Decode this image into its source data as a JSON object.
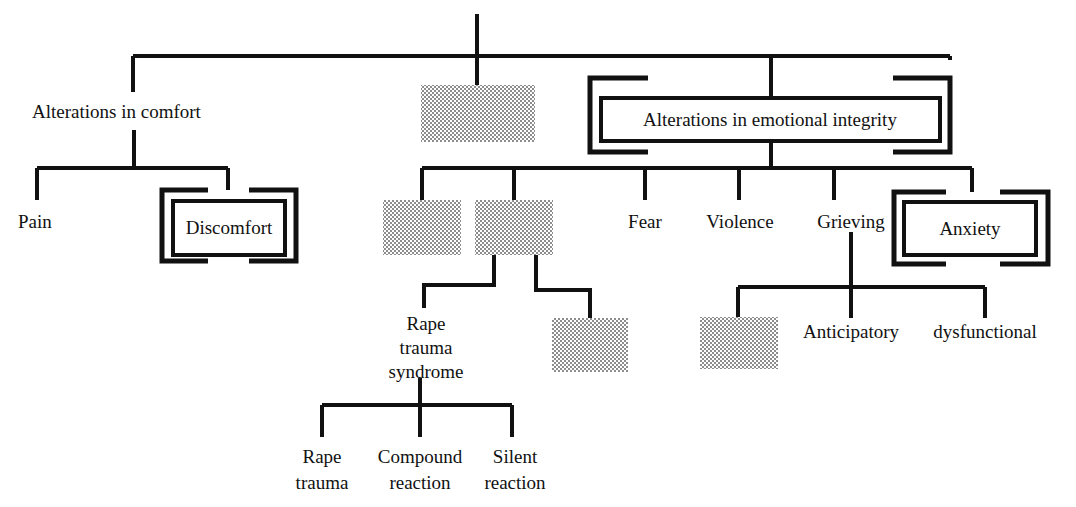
{
  "diagram": {
    "type": "hierarchy-tree",
    "colors": {
      "line": "#111111",
      "text": "#111111",
      "background": "#ffffff",
      "redacted_fill": "#b3b3b3"
    },
    "nodes": {
      "root_stub": {
        "label": ""
      },
      "alterations_in_comfort": {
        "label": "Alterations in comfort",
        "style": "plain"
      },
      "redacted_top_center": {
        "label": "",
        "style": "redacted"
      },
      "alterations_in_emotional_integrity": {
        "label": "Alterations in emotional integrity",
        "style": "double-bracket-box"
      },
      "pain": {
        "label": "Pain",
        "style": "plain"
      },
      "discomfort": {
        "label": "Discomfort",
        "style": "double-bracket-box"
      },
      "redacted_l2_a": {
        "label": "",
        "style": "redacted"
      },
      "redacted_l2_b": {
        "label": "",
        "style": "redacted"
      },
      "fear": {
        "label": "Fear",
        "style": "plain"
      },
      "violence": {
        "label": "Violence",
        "style": "plain"
      },
      "grieving": {
        "label": "Grieving",
        "style": "plain"
      },
      "anxiety": {
        "label": "Anxiety",
        "style": "double-bracket-box"
      },
      "rape_trauma_syndrome": {
        "label": "Rape\ntrauma\nsyndrome",
        "line1": "Rape",
        "line2": "trauma",
        "line3": "syndrome",
        "style": "plain"
      },
      "redacted_l3_right": {
        "label": "",
        "style": "redacted"
      },
      "redacted_grieving_child": {
        "label": "",
        "style": "redacted"
      },
      "anticipatory": {
        "label": "Anticipatory",
        "style": "plain"
      },
      "dysfunctional": {
        "label": "dysfunctional",
        "style": "plain"
      },
      "rape_trauma": {
        "label": "Rape\ntrauma",
        "line1": "Rape",
        "line2": "trauma",
        "style": "plain"
      },
      "compound_reaction": {
        "label": "Compound\nreaction",
        "line1": "Compound",
        "line2": "reaction",
        "style": "plain"
      },
      "silent_reaction": {
        "label": "Silent\nreaction",
        "line1": "Silent",
        "line2": "reaction",
        "style": "plain"
      }
    }
  }
}
